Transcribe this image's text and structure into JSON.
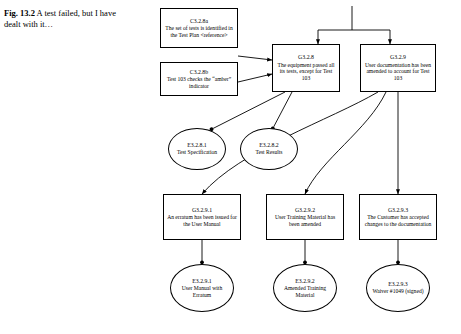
{
  "figure": {
    "label": "Fig. 13.2",
    "caption": "A test failed, but I have dealt with it…"
  },
  "diagram": {
    "type": "goal-structuring-notation",
    "nodes": [
      {
        "id": "c3.2.8a",
        "shape": "rect",
        "nid": "C3.2.8a",
        "text": "The set of tests is identified in the Test Plan <reference>"
      },
      {
        "id": "c3.2.8b",
        "shape": "rect",
        "nid": "C3.2.8b",
        "text": "Test 103 checks the “amber” indicator"
      },
      {
        "id": "g3.2.8",
        "shape": "rect",
        "nid": "G3.2.8",
        "text": "The equipment passed all its tests, except for Test 103"
      },
      {
        "id": "g3.2.9",
        "shape": "rect",
        "nid": "G3.2.9",
        "text": "User documentation has been amended to account for Test 103"
      },
      {
        "id": "e3.2.8.1",
        "shape": "oval",
        "nid": "E3.2.8.1",
        "text": "Test Specification"
      },
      {
        "id": "e3.2.8.2",
        "shape": "oval",
        "nid": "E3.2.8.2",
        "text": "Test Results"
      },
      {
        "id": "g3.2.9.1",
        "shape": "rect",
        "nid": "G3.2.9.1",
        "text": "An erratum has been issued for the User Manual"
      },
      {
        "id": "g3.2.9.2",
        "shape": "rect",
        "nid": "G3.2.9.2",
        "text": "User Training Material has been amended"
      },
      {
        "id": "g3.2.9.3",
        "shape": "rect",
        "nid": "G3.2.9.3",
        "text": "The Customer has accepted changes to the documentation"
      },
      {
        "id": "e3.2.9.1",
        "shape": "oval",
        "nid": "E3.2.9.1",
        "text": "User Manual with Erratum"
      },
      {
        "id": "e3.2.9.2",
        "shape": "oval",
        "nid": "E3.2.9.2",
        "text": "Amended Training Material"
      },
      {
        "id": "e3.2.9.3",
        "shape": "oval",
        "nid": "E3.2.9.3",
        "text": "Waiver #1049 (signed)"
      }
    ],
    "colors": {
      "stroke": "#000000",
      "fill": "#ffffff"
    }
  }
}
